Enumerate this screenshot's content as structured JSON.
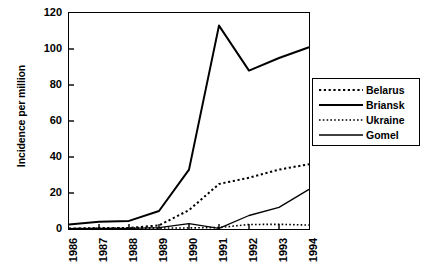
{
  "chart_data": {
    "type": "line",
    "title": "",
    "xlabel": "",
    "ylabel": "Incidence per million",
    "categories": [
      "1986",
      "1987",
      "1988",
      "1989",
      "1990",
      "1991",
      "1992",
      "1993",
      "1994"
    ],
    "x": [
      1986,
      1987,
      1988,
      1989,
      1990,
      1991,
      1992,
      1993,
      1994
    ],
    "xlim": [
      1986,
      1994
    ],
    "ylim": [
      0,
      120
    ],
    "yticks": [
      0,
      20,
      40,
      60,
      80,
      100,
      120
    ],
    "grid": false,
    "legend_position": "right",
    "series": [
      {
        "name": "Belarus",
        "style": "dotted-coarse",
        "values": [
          0.3,
          0.5,
          0.6,
          2.0,
          10.5,
          25.0,
          28.5,
          33.0,
          36.0
        ]
      },
      {
        "name": "Briansk",
        "style": "solid-thick",
        "values": [
          2.5,
          4.0,
          4.5,
          10.0,
          33.0,
          113.0,
          88.0,
          95.0,
          101.0
        ]
      },
      {
        "name": "Ukraine",
        "style": "dotted-fine",
        "values": [
          0.2,
          0.4,
          0.5,
          0.5,
          0.6,
          0.8,
          2.5,
          2.6,
          2.2
        ]
      },
      {
        "name": "Gomel",
        "style": "solid-thin",
        "values": [
          0.2,
          0.3,
          0.4,
          0.8,
          3.0,
          0.3,
          7.5,
          12.0,
          22.0
        ]
      }
    ]
  },
  "axes": {
    "y_title": "Incidence per million",
    "y_tick_labels": [
      "0",
      "20",
      "40",
      "60",
      "80",
      "100",
      "120"
    ],
    "x_tick_labels": [
      "1986",
      "1987",
      "1988",
      "1989",
      "1990",
      "1991",
      "1992",
      "1993",
      "1994"
    ]
  },
  "legend": {
    "entries": [
      {
        "label": "Belarus"
      },
      {
        "label": "Briansk"
      },
      {
        "label": "Ukraine"
      },
      {
        "label": "Gomel"
      }
    ]
  },
  "colors": {
    "ink": "#000000",
    "background": "#ffffff"
  }
}
